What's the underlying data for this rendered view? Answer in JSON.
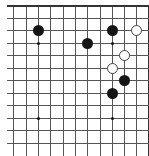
{
  "board": {
    "grid": {
      "columns_x": [
        13,
        26,
        38,
        50,
        63,
        75,
        87,
        100,
        112,
        124,
        136,
        148
      ],
      "rows_y": [
        5,
        18,
        30,
        43,
        55,
        68,
        80,
        93,
        105,
        118,
        130,
        143
      ],
      "top_edge_y": 5,
      "right_edge_x": 148,
      "line_color": "#555555"
    },
    "star_points": [
      {
        "col": 2,
        "row": 3
      },
      {
        "col": 8,
        "row": 3
      },
      {
        "col": 2,
        "row": 9
      },
      {
        "col": 8,
        "row": 9
      }
    ],
    "stones": [
      {
        "color": "black",
        "col": 2,
        "row": 2
      },
      {
        "color": "black",
        "col": 6,
        "row": 3
      },
      {
        "color": "black",
        "col": 8,
        "row": 2
      },
      {
        "color": "white",
        "col": 10,
        "row": 2
      },
      {
        "color": "white",
        "col": 9,
        "row": 4
      },
      {
        "color": "white",
        "col": 8,
        "row": 5
      },
      {
        "color": "black",
        "col": 9,
        "row": 6
      },
      {
        "color": "black",
        "col": 8,
        "row": 7
      }
    ]
  }
}
